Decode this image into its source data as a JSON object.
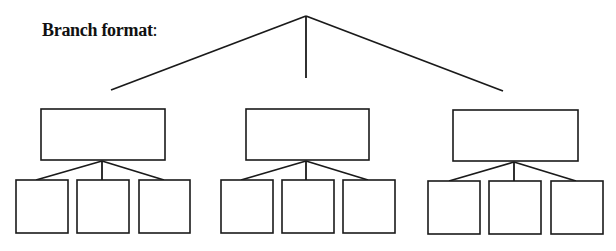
{
  "title": {
    "text": "Branch format",
    "punctuation": ":"
  },
  "diagram": {
    "type": "tree",
    "levels": 3,
    "root": {
      "apex": [
        306,
        16
      ],
      "label": ""
    },
    "stroke_color": "#1a1a1a",
    "branches": [
      {
        "name": "left",
        "box": {
          "x": 41,
          "y": 109,
          "w": 124,
          "h": 51,
          "label": ""
        },
        "connector_from_root": [
          111,
          90
        ],
        "fork": [
          102,
          161
        ],
        "children": [
          {
            "x": 16,
            "y": 180,
            "w": 52,
            "h": 53,
            "label": "",
            "anchor": [
              36,
              180
            ]
          },
          {
            "x": 77,
            "y": 180,
            "w": 52,
            "h": 53,
            "label": "",
            "anchor": [
              102,
              180
            ]
          },
          {
            "x": 139,
            "y": 180,
            "w": 51,
            "h": 53,
            "label": "",
            "anchor": [
              164,
              180
            ]
          }
        ]
      },
      {
        "name": "center",
        "box": {
          "x": 246,
          "y": 109,
          "w": 123,
          "h": 51,
          "label": ""
        },
        "connector_from_root": [
          306,
          78
        ],
        "fork": [
          306,
          161
        ],
        "children": [
          {
            "x": 221,
            "y": 180,
            "w": 52,
            "h": 53,
            "label": "",
            "anchor": [
              241,
              180
            ]
          },
          {
            "x": 282,
            "y": 180,
            "w": 52,
            "h": 53,
            "label": "",
            "anchor": [
              306,
              180
            ]
          },
          {
            "x": 343,
            "y": 180,
            "w": 52,
            "h": 53,
            "label": "",
            "anchor": [
              368,
              180
            ]
          }
        ]
      },
      {
        "name": "right",
        "box": {
          "x": 453,
          "y": 110,
          "w": 125,
          "h": 51,
          "label": ""
        },
        "connector_from_root": [
          503,
          91
        ],
        "fork": [
          514,
          162
        ],
        "children": [
          {
            "x": 428,
            "y": 181,
            "w": 52,
            "h": 53,
            "label": "",
            "anchor": [
              449,
              181
            ]
          },
          {
            "x": 489,
            "y": 181,
            "w": 52,
            "h": 53,
            "label": "",
            "anchor": [
              514,
              181
            ]
          },
          {
            "x": 551,
            "y": 181,
            "w": 52,
            "h": 53,
            "label": "",
            "anchor": [
              576,
              181
            ]
          }
        ]
      }
    ]
  }
}
